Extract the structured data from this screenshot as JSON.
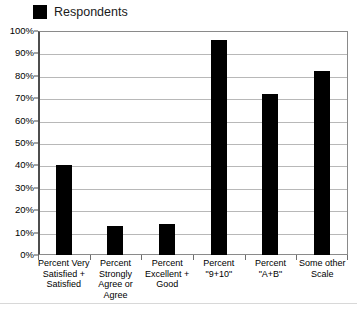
{
  "chart_data": {
    "type": "bar",
    "title": "",
    "xlabel": "",
    "ylabel": "",
    "ylim": [
      0,
      100
    ],
    "grid": true,
    "legend_position": "top-left",
    "legend": [
      "Respondents"
    ],
    "series": [
      {
        "name": "Respondents",
        "color": "#000000",
        "values": [
          40,
          13,
          14,
          96,
          72,
          82
        ]
      }
    ],
    "categories": [
      "Percent Very Satisfied + Satisfied",
      "Percent Strongly Agree or Agree",
      "Percent Excellent + Good",
      "Percent \"9+10\"",
      "Percent \"A+B\"",
      "Some other Scale"
    ],
    "category_label_lines": [
      [
        "Percent Very",
        "Satisfied +",
        "Satisfied"
      ],
      [
        "Percent",
        "Strongly",
        "Agree or",
        "Agree"
      ],
      [
        "Percent",
        "Excellent +",
        "Good"
      ],
      [
        "Percent",
        "\"9+10\""
      ],
      [
        "Percent",
        "\"A+B\""
      ],
      [
        "Some other",
        "Scale"
      ]
    ],
    "y_tick_labels": [
      "100%",
      "90%",
      "80%",
      "70%",
      "60%",
      "50%",
      "40%",
      "30%",
      "20%",
      "10%",
      "0%"
    ],
    "y_tick_values": [
      100,
      90,
      80,
      70,
      60,
      50,
      40,
      30,
      20,
      10,
      0
    ]
  },
  "legend": {
    "label": "Respondents",
    "swatch_color": "#000000"
  },
  "axes": {
    "grid_color": "#b8b8b8",
    "frame_color": "#8a8a8a",
    "axis_color": "#4d4d4d"
  }
}
